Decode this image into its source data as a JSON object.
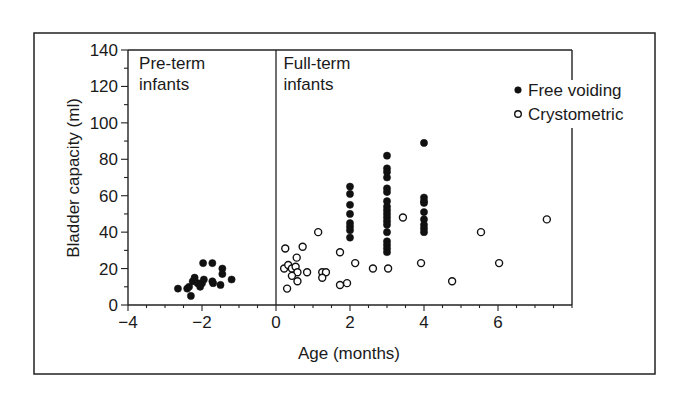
{
  "chart_data": {
    "type": "scatter",
    "title": "",
    "xlabel": "Age (months)",
    "ylabel": "Bladder capacity (ml)",
    "xlim": [
      -4,
      8
    ],
    "ylim": [
      0,
      140
    ],
    "xticks": [
      -4,
      -2,
      0,
      2,
      4,
      6
    ],
    "xtick_labels": [
      "−4",
      "−2",
      "0",
      "2",
      "4",
      "6"
    ],
    "yticks": [
      0,
      20,
      40,
      60,
      80,
      100,
      120,
      140
    ],
    "ytick_labels": [
      "0",
      "20",
      "40",
      "60",
      "80",
      "100",
      "120",
      "140"
    ],
    "x_minor_step": 0.5,
    "y_minor_step": 10,
    "grid": false,
    "legend_position": "top-right",
    "divider_x": 0,
    "region_labels": [
      {
        "text": [
          "Pre-term",
          "infants"
        ],
        "x": -3.7,
        "y": 132
      },
      {
        "text": [
          "Full-term",
          "infants"
        ],
        "x": 0.2,
        "y": 132
      }
    ],
    "series": [
      {
        "name": "Free voiding",
        "marker": "filled-circle",
        "points": [
          [
            -2.65,
            9
          ],
          [
            -2.4,
            9
          ],
          [
            -2.35,
            10
          ],
          [
            -2.3,
            5
          ],
          [
            -2.25,
            13
          ],
          [
            -2.2,
            15
          ],
          [
            -2.12,
            12
          ],
          [
            -2.05,
            10
          ],
          [
            -2.0,
            12
          ],
          [
            -1.95,
            14
          ],
          [
            -1.97,
            23
          ],
          [
            -1.72,
            23
          ],
          [
            -1.7,
            12
          ],
          [
            -1.72,
            13
          ],
          [
            -1.45,
            20
          ],
          [
            -1.45,
            17
          ],
          [
            -1.5,
            11
          ],
          [
            -1.2,
            14
          ],
          [
            2,
            65
          ],
          [
            2,
            61
          ],
          [
            2,
            55
          ],
          [
            2,
            50
          ],
          [
            2,
            45
          ],
          [
            2,
            43
          ],
          [
            2,
            41
          ],
          [
            2,
            37
          ],
          [
            3,
            82
          ],
          [
            3,
            75
          ],
          [
            3,
            73
          ],
          [
            3,
            70
          ],
          [
            3,
            64
          ],
          [
            3,
            62
          ],
          [
            3,
            57
          ],
          [
            3,
            54
          ],
          [
            3,
            52
          ],
          [
            3,
            50
          ],
          [
            3,
            48
          ],
          [
            3,
            46
          ],
          [
            3,
            44
          ],
          [
            3,
            40
          ],
          [
            3,
            35
          ],
          [
            3,
            33
          ],
          [
            3,
            31
          ],
          [
            3,
            29
          ],
          [
            4,
            89
          ],
          [
            4,
            59
          ],
          [
            4,
            57
          ],
          [
            4,
            56
          ],
          [
            4,
            51
          ],
          [
            4,
            47
          ],
          [
            4,
            44
          ],
          [
            4,
            42
          ],
          [
            4,
            40
          ]
        ]
      },
      {
        "name": "Crystometric",
        "marker": "open-circle",
        "points": [
          [
            0.25,
            31
          ],
          [
            0.22,
            20
          ],
          [
            0.33,
            22
          ],
          [
            0.43,
            20
          ],
          [
            0.53,
            21
          ],
          [
            0.58,
            18
          ],
          [
            0.43,
            16
          ],
          [
            0.56,
            26
          ],
          [
            0.72,
            32
          ],
          [
            0.84,
            18
          ],
          [
            0.58,
            13
          ],
          [
            0.3,
            9
          ],
          [
            1.14,
            40
          ],
          [
            1.25,
            18
          ],
          [
            1.35,
            18
          ],
          [
            1.25,
            15
          ],
          [
            1.73,
            29
          ],
          [
            1.73,
            11
          ],
          [
            1.92,
            12
          ],
          [
            2.14,
            23
          ],
          [
            2.62,
            20
          ],
          [
            3.03,
            20
          ],
          [
            3.43,
            48
          ],
          [
            3.92,
            23
          ],
          [
            4.76,
            13
          ],
          [
            5.54,
            40
          ],
          [
            6.03,
            23
          ],
          [
            7.32,
            47
          ]
        ]
      }
    ]
  }
}
